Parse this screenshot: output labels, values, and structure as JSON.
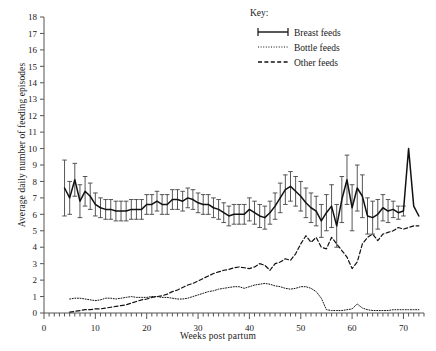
{
  "chart_data": {
    "type": "line",
    "title": "",
    "xlabel": "Weeks post partum",
    "ylabel": "Average daily number of feeding episodes",
    "xlim": [
      0,
      74
    ],
    "ylim": [
      0,
      18
    ],
    "xticks": [
      0,
      10,
      20,
      30,
      40,
      50,
      60,
      70
    ],
    "yticks": [
      0,
      1,
      2,
      3,
      4,
      5,
      6,
      7,
      8,
      9,
      10,
      11,
      12,
      13,
      14,
      15,
      16,
      17,
      18
    ],
    "grid": false,
    "legend_title": "Key:",
    "legend_position": "top-center-right",
    "series": [
      {
        "name": "Breast feeds",
        "style": "solid-with-errorbars",
        "x": [
          4,
          5,
          6,
          7,
          8,
          9,
          10,
          11,
          12,
          13,
          14,
          15,
          16,
          17,
          18,
          19,
          20,
          21,
          22,
          23,
          24,
          25,
          26,
          27,
          28,
          29,
          30,
          31,
          32,
          33,
          34,
          35,
          36,
          37,
          38,
          39,
          40,
          41,
          42,
          43,
          44,
          45,
          46,
          47,
          48,
          49,
          50,
          51,
          52,
          53,
          54,
          55,
          56,
          57,
          58,
          59,
          60,
          61,
          62,
          63,
          64,
          65,
          66,
          67,
          68,
          69,
          70,
          71,
          72,
          73
        ],
        "values": [
          7.6,
          7.0,
          8.1,
          6.8,
          7.4,
          7.1,
          6.6,
          6.4,
          6.3,
          6.3,
          6.2,
          6.2,
          6.2,
          6.3,
          6.3,
          6.3,
          6.6,
          6.6,
          6.8,
          6.6,
          6.6,
          6.9,
          6.9,
          6.8,
          7.0,
          6.9,
          6.7,
          6.6,
          6.6,
          6.4,
          6.3,
          6.1,
          5.9,
          6.0,
          6.0,
          6.0,
          6.3,
          6.1,
          5.9,
          5.8,
          6.1,
          6.5,
          7.0,
          7.5,
          7.7,
          7.4,
          7.1,
          6.7,
          6.4,
          6.2,
          5.6,
          6.1,
          6.5,
          5.3,
          6.9,
          8.1,
          6.4,
          7.6,
          7.1,
          5.9,
          5.8,
          6.0,
          6.4,
          6.2,
          6.3,
          6.1,
          6.2,
          10.0,
          6.5,
          5.9
        ],
        "err_low": [
          1.7,
          1.0,
          1.0,
          1.0,
          0.9,
          0.8,
          0.7,
          0.6,
          0.6,
          0.6,
          0.6,
          0.6,
          0.6,
          0.6,
          0.6,
          0.6,
          0.6,
          0.6,
          0.6,
          0.6,
          0.6,
          0.6,
          0.6,
          0.6,
          0.6,
          0.6,
          0.6,
          0.6,
          0.6,
          0.6,
          0.6,
          0.6,
          0.6,
          0.6,
          0.6,
          0.6,
          0.7,
          0.7,
          0.7,
          0.7,
          0.7,
          0.8,
          0.9,
          0.9,
          0.9,
          0.9,
          0.9,
          0.9,
          0.9,
          0.9,
          1.0,
          1.1,
          1.3,
          1.3,
          1.4,
          1.5,
          1.4,
          1.4,
          1.3,
          1.1,
          1.0,
          0.9,
          0.8,
          0.7,
          0.5,
          0.4,
          0.3,
          0.0,
          0.0,
          0.0
        ],
        "err_high": [
          1.7,
          1.0,
          1.0,
          1.0,
          0.9,
          0.8,
          0.7,
          0.6,
          0.6,
          0.6,
          0.6,
          0.6,
          0.6,
          0.6,
          0.6,
          0.6,
          0.6,
          0.6,
          0.6,
          0.6,
          0.6,
          0.6,
          0.6,
          0.6,
          0.6,
          0.6,
          0.6,
          0.6,
          0.6,
          0.6,
          0.6,
          0.6,
          0.6,
          0.6,
          0.6,
          0.6,
          0.7,
          0.7,
          0.7,
          0.7,
          0.7,
          0.8,
          0.9,
          0.9,
          0.9,
          0.9,
          0.9,
          0.9,
          0.9,
          0.9,
          1.0,
          1.1,
          1.3,
          1.3,
          1.4,
          1.5,
          1.4,
          1.4,
          1.3,
          1.1,
          1.0,
          0.9,
          0.8,
          0.7,
          0.5,
          0.4,
          0.3,
          0.0,
          0.0,
          0.0
        ]
      },
      {
        "name": "Bottle feeds",
        "style": "dotted",
        "x": [
          5,
          6,
          7,
          8,
          9,
          10,
          11,
          12,
          13,
          14,
          15,
          16,
          17,
          18,
          19,
          20,
          21,
          22,
          23,
          24,
          25,
          26,
          27,
          28,
          29,
          30,
          31,
          32,
          33,
          34,
          35,
          36,
          37,
          38,
          39,
          40,
          41,
          42,
          43,
          44,
          45,
          46,
          47,
          48,
          49,
          50,
          51,
          52,
          53,
          54,
          55,
          56,
          57,
          58,
          59,
          60,
          61,
          62,
          63,
          64,
          65,
          66,
          67,
          68,
          69,
          70,
          71,
          72,
          73
        ],
        "values": [
          0.85,
          0.9,
          0.9,
          0.85,
          0.8,
          0.75,
          0.8,
          0.9,
          0.9,
          0.85,
          0.9,
          0.95,
          1.0,
          0.95,
          0.95,
          0.95,
          1.0,
          1.0,
          0.95,
          0.95,
          0.9,
          0.85,
          0.85,
          0.9,
          1.0,
          1.1,
          1.2,
          1.3,
          1.35,
          1.45,
          1.5,
          1.55,
          1.6,
          1.6,
          1.5,
          1.6,
          1.7,
          1.75,
          1.8,
          1.75,
          1.65,
          1.6,
          1.5,
          1.45,
          1.5,
          1.6,
          1.6,
          1.5,
          1.3,
          0.9,
          0.2,
          0.15,
          0.15,
          0.15,
          0.2,
          0.25,
          0.55,
          0.3,
          0.2,
          0.15,
          0.15,
          0.15,
          0.15,
          0.2,
          0.2,
          0.2,
          0.2,
          0.2,
          0.2
        ]
      },
      {
        "name": "Other feeds",
        "style": "dashed",
        "x": [
          5,
          6,
          7,
          8,
          9,
          10,
          11,
          12,
          13,
          14,
          15,
          16,
          17,
          18,
          19,
          20,
          21,
          22,
          23,
          24,
          25,
          26,
          27,
          28,
          29,
          30,
          31,
          32,
          33,
          34,
          35,
          36,
          37,
          38,
          39,
          40,
          41,
          42,
          43,
          44,
          45,
          46,
          47,
          48,
          49,
          50,
          51,
          52,
          53,
          54,
          55,
          56,
          57,
          58,
          59,
          60,
          61,
          62,
          63,
          64,
          65,
          66,
          67,
          68,
          69,
          70,
          71,
          72,
          73
        ],
        "values": [
          0.05,
          0.1,
          0.15,
          0.2,
          0.2,
          0.25,
          0.25,
          0.3,
          0.35,
          0.4,
          0.45,
          0.5,
          0.6,
          0.7,
          0.8,
          0.85,
          0.95,
          1.0,
          1.05,
          1.15,
          1.3,
          1.4,
          1.55,
          1.7,
          1.8,
          1.95,
          2.1,
          2.25,
          2.4,
          2.5,
          2.6,
          2.65,
          2.75,
          2.8,
          2.75,
          2.7,
          2.8,
          3.0,
          2.9,
          2.6,
          3.0,
          3.1,
          3.3,
          3.2,
          3.6,
          4.2,
          4.7,
          4.3,
          4.6,
          4.0,
          3.9,
          4.6,
          4.2,
          3.8,
          3.4,
          2.7,
          3.1,
          4.2,
          4.6,
          4.8,
          4.4,
          4.8,
          4.9,
          5.0,
          5.2,
          5.1,
          5.2,
          5.3,
          5.3
        ]
      }
    ]
  },
  "axes": {
    "x_tick_labels": [
      "0",
      "10",
      "20",
      "30",
      "40",
      "50",
      "60",
      "70"
    ],
    "y_tick_labels": [
      "0",
      "1",
      "2",
      "3",
      "4",
      "5",
      "6",
      "7",
      "8",
      "9",
      "10",
      "11",
      "12",
      "13",
      "14",
      "15",
      "16",
      "17",
      "18"
    ]
  },
  "legend": {
    "title": "Key:",
    "items": [
      {
        "label": "Breast feeds",
        "marker": "solid-errorbar"
      },
      {
        "label": "Bottle feeds",
        "marker": "dotted"
      },
      {
        "label": "Other feeds",
        "marker": "dashed"
      }
    ]
  },
  "colors": {
    "line": "#111111",
    "axis": "#555555",
    "background": "#ffffff"
  }
}
